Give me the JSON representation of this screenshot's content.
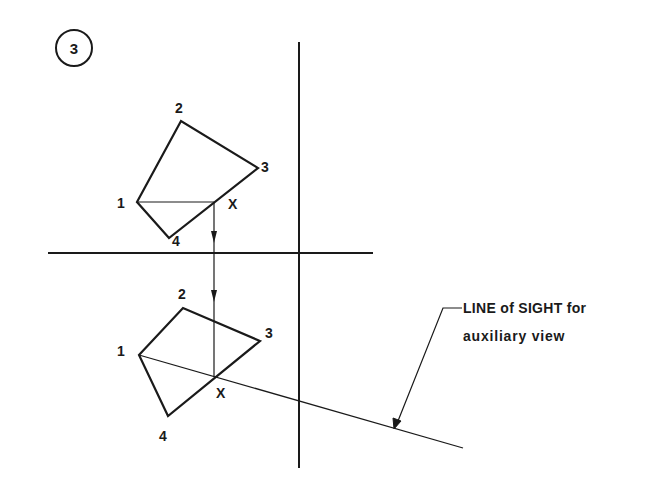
{
  "figure": {
    "step_number": "3",
    "top_view": {
      "labels": {
        "p1": "1",
        "p2": "2",
        "p3": "3",
        "p4": "4",
        "px": "X"
      }
    },
    "front_view": {
      "labels": {
        "p1": "1",
        "p2": "2",
        "p3": "3",
        "p4": "4",
        "px": "X"
      }
    },
    "annotation": {
      "line1": "LINE of SIGHT for",
      "line2": "auxiliary view"
    },
    "colors": {
      "ink": "#1a1a1a",
      "background": "#ffffff"
    }
  }
}
